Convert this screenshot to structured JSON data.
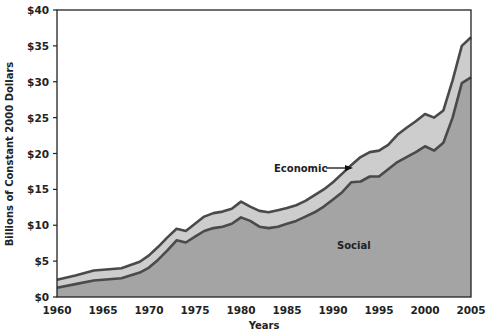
{
  "chart_data": {
    "type": "area",
    "stacked": true,
    "title": "",
    "xlabel": "Years",
    "ylabel": "Billions of Constant 2000 Dollars",
    "xlim": [
      1960,
      2005
    ],
    "ylim": [
      0,
      40
    ],
    "grid": false,
    "legend": "none (inline annotations)",
    "x_ticks": [
      "1960",
      "1965",
      "1970",
      "1975",
      "1980",
      "1985",
      "1990",
      "1995",
      "2000",
      "2005"
    ],
    "y_ticks": [
      "$0",
      "$5",
      "$10",
      "$15",
      "$20",
      "$25",
      "$30",
      "$35",
      "$40"
    ],
    "annotations": [
      {
        "text": "Economic",
        "arrow": true,
        "target_year": 1994,
        "target_value": 18.5
      },
      {
        "text": "Social",
        "x_year": 1993,
        "y_value": 6.8
      }
    ],
    "series": [
      {
        "name": "Social",
        "color": "#a4a4a4",
        "x": [
          1960,
          1962,
          1964,
          1965,
          1967,
          1969,
          1970,
          1971,
          1972,
          1973,
          1974,
          1975,
          1976,
          1977,
          1978,
          1979,
          1980,
          1981,
          1982,
          1983,
          1984,
          1985,
          1986,
          1987,
          1988,
          1989,
          1990,
          1991,
          1992,
          1993,
          1994,
          1995,
          1996,
          1997,
          1998,
          1999,
          2000,
          2001,
          2002,
          2003,
          2004,
          2005
        ],
        "values": [
          1.3,
          1.8,
          2.3,
          2.4,
          2.6,
          3.4,
          4.1,
          5.2,
          6.5,
          7.9,
          7.6,
          8.4,
          9.2,
          9.6,
          9.8,
          10.2,
          11.1,
          10.6,
          9.8,
          9.6,
          9.8,
          10.2,
          10.6,
          11.2,
          11.8,
          12.6,
          13.6,
          14.6,
          16.0,
          16.1,
          16.8,
          16.8,
          17.8,
          18.8,
          19.5,
          20.2,
          21.0,
          20.4,
          21.5,
          25.0,
          29.8,
          30.6
        ]
      },
      {
        "name": "Economic",
        "color": "#cdcdcd",
        "x": [
          1960,
          1962,
          1964,
          1965,
          1967,
          1969,
          1970,
          1971,
          1972,
          1973,
          1974,
          1975,
          1976,
          1977,
          1978,
          1979,
          1980,
          1981,
          1982,
          1983,
          1984,
          1985,
          1986,
          1987,
          1988,
          1989,
          1990,
          1991,
          1992,
          1993,
          1994,
          1995,
          1996,
          1997,
          1998,
          1999,
          2000,
          2001,
          2002,
          2003,
          2004,
          2005
        ],
        "values": [
          1.1,
          1.2,
          1.4,
          1.4,
          1.4,
          1.5,
          1.7,
          1.8,
          1.8,
          1.6,
          1.6,
          1.8,
          2.0,
          2.1,
          2.1,
          2.1,
          2.2,
          2.0,
          2.2,
          2.2,
          2.3,
          2.2,
          2.2,
          2.2,
          2.4,
          2.4,
          2.4,
          2.6,
          2.4,
          3.4,
          3.4,
          3.6,
          3.4,
          3.8,
          4.1,
          4.3,
          4.5,
          4.6,
          4.5,
          5.2,
          5.2,
          5.6
        ]
      }
    ],
    "total": [
      2.4,
      3.0,
      3.7,
      3.8,
      4.0,
      4.9,
      5.8,
      7.0,
      8.3,
      9.5,
      9.2,
      10.2,
      11.2,
      11.7,
      11.9,
      12.3,
      13.3,
      12.6,
      12.0,
      11.8,
      12.1,
      12.4,
      12.8,
      13.4,
      14.2,
      15.0,
      16.0,
      17.2,
      18.4,
      19.5,
      20.2,
      20.4,
      21.2,
      22.6,
      23.6,
      24.5,
      25.5,
      25.0,
      26.0,
      30.2,
      35.0,
      36.2
    ]
  },
  "labels": {
    "economic": "Economic",
    "social": "Social",
    "xlabel": "Years",
    "ylabel": "Billions of Constant 2000 Dollars"
  }
}
